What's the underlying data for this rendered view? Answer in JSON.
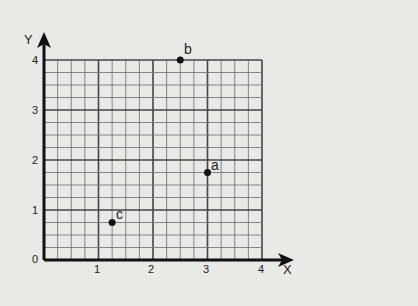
{
  "chart_data": {
    "type": "scatter",
    "title": "",
    "xlabel": "X",
    "ylabel": "Y",
    "xlim": [
      0,
      4
    ],
    "ylim": [
      0,
      4
    ],
    "x_ticks": [
      "0",
      "1",
      "2",
      "3",
      "4"
    ],
    "y_ticks": [
      "0",
      "1",
      "2",
      "3",
      "4"
    ],
    "grid": true,
    "minor_divisions_per_unit": 4,
    "points": [
      {
        "label": "a",
        "x": 3.0,
        "y": 1.75
      },
      {
        "label": "b",
        "x": 2.5,
        "y": 4.0
      },
      {
        "label": "c",
        "x": 1.25,
        "y": 0.75
      }
    ]
  },
  "labels": {
    "x_axis": "X",
    "y_axis": "Y",
    "origin": "0",
    "x1": "1",
    "x2": "2",
    "x3": "3",
    "x4": "4",
    "y1": "1",
    "y2": "2",
    "y3": "3",
    "y4": "4",
    "point_a": "a",
    "point_b": "b",
    "point_c": "c"
  },
  "colors": {
    "background": "#e9e9e6",
    "grid_minor": "#777777",
    "grid_major": "#444444",
    "axis": "#111111",
    "point": "#111111"
  }
}
